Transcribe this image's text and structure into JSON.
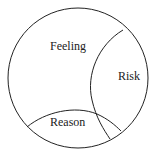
{
  "diagram": {
    "type": "venn-like",
    "regions": [
      {
        "id": "feeling",
        "label": "Feeling"
      },
      {
        "id": "risk",
        "label": "Risk"
      },
      {
        "id": "reason",
        "label": "Reason"
      }
    ],
    "stroke_color": "#222222",
    "background": "#ffffff"
  }
}
